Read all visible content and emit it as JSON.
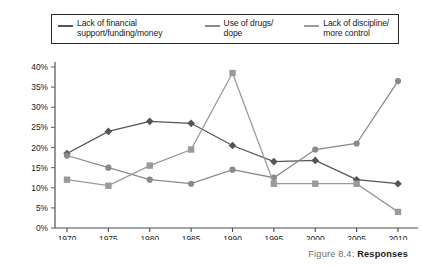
{
  "figure": {
    "caption_label": "Figure 8.4:",
    "caption_title": "Responses"
  },
  "legend": {
    "items": [
      {
        "label_line1": "Lack of financial",
        "label_line2": "support/funding/money",
        "color": "#555555",
        "marker": "diamond"
      },
      {
        "label_line1": "Use of drugs/",
        "label_line2": "dope",
        "color": "#8a8a8a",
        "marker": "circle"
      },
      {
        "label_line1": "Lack of discipline/",
        "label_line2": "more control",
        "color": "#9a9a9a",
        "marker": "square"
      }
    ]
  },
  "chart_data": {
    "type": "line",
    "title": "",
    "xlabel": "",
    "ylabel": "",
    "categories": [
      "1970",
      "1975",
      "1980",
      "1985",
      "1990",
      "1995",
      "2000",
      "2005",
      "2010"
    ],
    "ylim": [
      0,
      40
    ],
    "ytick_labels": [
      "0%",
      "5%",
      "10%",
      "15%",
      "20%",
      "25%",
      "30%",
      "35%",
      "40%"
    ],
    "ytick_values": [
      0,
      5,
      10,
      15,
      20,
      25,
      30,
      35,
      40
    ],
    "grid": false,
    "legend_position": "top",
    "series": [
      {
        "name": "Lack of financial support/funding/money",
        "color": "#555555",
        "marker": "diamond",
        "values": [
          18.5,
          24.0,
          26.5,
          26.0,
          20.5,
          16.5,
          16.8,
          12.0,
          11.0
        ]
      },
      {
        "name": "Use of drugs/dope",
        "color": "#8a8a8a",
        "marker": "circle",
        "values": [
          18.0,
          15.0,
          12.0,
          11.0,
          14.5,
          12.5,
          19.5,
          21.0,
          36.5
        ]
      },
      {
        "name": "Lack of discipline/more control",
        "color": "#9a9a9a",
        "marker": "square",
        "values": [
          12.0,
          10.5,
          15.5,
          19.5,
          38.5,
          11.0,
          11.0,
          11.0,
          4.0
        ]
      }
    ]
  }
}
